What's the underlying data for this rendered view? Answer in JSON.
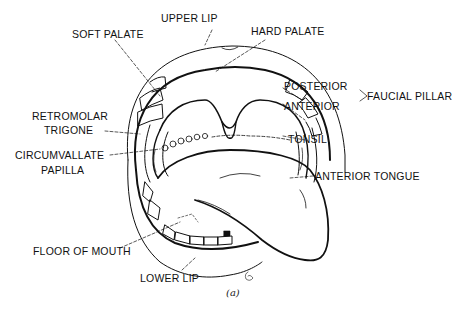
{
  "diagram": {
    "caption": "(a)",
    "labels": {
      "upper_lip": "UPPER LIP",
      "soft_palate": "SOFT PALATE",
      "hard_palate": "HARD PALATE",
      "posterior": "POSTERIOR",
      "anterior": "ANTERIOR",
      "faucial_pillar": "FAUCIAL PILLAR",
      "retromolar_line1": "RETROMOLAR",
      "retromolar_line2": "TRIGONE",
      "tonsil": "TONSIL",
      "circumvallate_line1": "CIRCUMVALLATE",
      "circumvallate_line2": "PAPILLA",
      "anterior_tongue": "ANTERIOR TONGUE",
      "floor_of_mouth": "FLOOR OF MOUTH",
      "lower_lip": "LOWER LIP"
    },
    "colors": {
      "line": "#111111",
      "background": "#ffffff"
    }
  }
}
